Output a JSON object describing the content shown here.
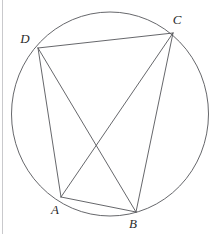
{
  "figure": {
    "kind": "cyclic-quadrilateral-diagram",
    "background_color": "#ffffff",
    "stroke_color": "#55565a",
    "label_color": "#2b2b2b",
    "frame_color": "#c9c9cc",
    "canvas": {
      "width": 222,
      "height": 234
    },
    "circle": {
      "cx": 110,
      "cy": 114,
      "rx": 98.5,
      "ry": 102
    },
    "frame_left_rule_x": 2.5,
    "points": [
      {
        "id": "A",
        "label": "A",
        "x": 61,
        "y": 197,
        "label_x": 55,
        "label_y": 214
      },
      {
        "id": "B",
        "label": "B",
        "x": 136,
        "y": 212,
        "label_x": 133,
        "label_y": 228
      },
      {
        "id": "C",
        "label": "C",
        "x": 173,
        "y": 33,
        "label_x": 177,
        "label_y": 24
      },
      {
        "id": "D",
        "label": "D",
        "x": 38,
        "y": 48,
        "label_x": 25,
        "label_y": 43
      }
    ],
    "segments": [
      {
        "id": "DC",
        "from": "D",
        "to": "C",
        "kind": "side"
      },
      {
        "id": "DA",
        "from": "D",
        "to": "A",
        "kind": "side"
      },
      {
        "id": "AB",
        "from": "A",
        "to": "B",
        "kind": "side"
      },
      {
        "id": "BC",
        "from": "B",
        "to": "C",
        "kind": "side"
      },
      {
        "id": "AC",
        "from": "A",
        "to": "C",
        "kind": "diagonal"
      },
      {
        "id": "DB",
        "from": "D",
        "to": "B",
        "kind": "diagonal"
      }
    ]
  }
}
